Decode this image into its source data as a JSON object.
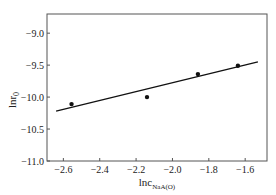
{
  "chart_data": {
    "type": "scatter",
    "title": "",
    "xlabel": "lnc",
    "xlabel_subscript": "NaA(O)",
    "ylabel": "lnr",
    "ylabel_subscript": "0",
    "xlim": [
      -2.69,
      -1.48
    ],
    "ylim": [
      -11.0,
      -8.7
    ],
    "xticks": [
      -2.6,
      -2.4,
      -2.2,
      -2.0,
      -1.8,
      -1.6
    ],
    "xtick_labels": [
      "−2.6",
      "−2.4",
      "−2.2",
      "−2.0",
      "−1.8",
      "−1.6"
    ],
    "yticks": [
      -9.0,
      -9.5,
      -10.0,
      -10.5,
      -11.0
    ],
    "ytick_labels": [
      "−9.0",
      "−9.5",
      "−10.0",
      "−10.5",
      "−11.0"
    ],
    "grid": false,
    "legend": null,
    "series": [
      {
        "name": "data",
        "mode": "markers",
        "x": [
          -2.555,
          -2.14,
          -1.86,
          -1.64
        ],
        "y": [
          -10.11,
          -10.0,
          -9.64,
          -9.51
        ]
      },
      {
        "name": "linear fit",
        "mode": "line",
        "x": [
          -2.64,
          -1.53
        ],
        "y": [
          -10.22,
          -9.45
        ]
      }
    ]
  }
}
